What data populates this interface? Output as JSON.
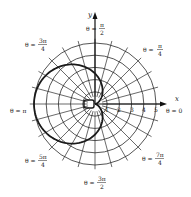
{
  "figure": {
    "curve": "r = 2.5(1 - cos θ)",
    "curve_color": "#1a1a1a",
    "grid_color": "#2a2a2a"
  },
  "axes": {
    "x_label": "x",
    "y_label": "y",
    "radial_ticks": [
      "1",
      "2",
      "3",
      "4",
      "5"
    ]
  },
  "angle_labels": [
    {
      "id": "theta-0",
      "prefix": "θ = ",
      "num": "0",
      "den": ""
    },
    {
      "id": "theta-pi-4",
      "prefix": "θ = ",
      "num": "π",
      "den": "4"
    },
    {
      "id": "theta-pi-2",
      "prefix": "θ = ",
      "num": "π",
      "den": "2"
    },
    {
      "id": "theta-3pi-4",
      "prefix": "θ = ",
      "num": "3π",
      "den": "4"
    },
    {
      "id": "theta-pi",
      "prefix": "θ = ",
      "num": "π",
      "den": ""
    },
    {
      "id": "theta-5pi-4",
      "prefix": "θ = ",
      "num": "5π",
      "den": "4"
    },
    {
      "id": "theta-3pi-2",
      "prefix": "θ = ",
      "num": "3π",
      "den": "2"
    },
    {
      "id": "theta-7pi-4",
      "prefix": "θ = ",
      "num": "7π",
      "den": "4"
    }
  ]
}
